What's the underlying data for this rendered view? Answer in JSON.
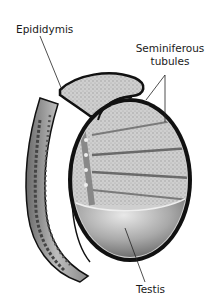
{
  "figure": {
    "labels": {
      "epididymis": "Epididymis",
      "seminiferous_line1": "Seminiferous",
      "seminiferous_line2": "tubules",
      "testis": "Testis"
    },
    "colors": {
      "background": "#ffffff",
      "outline": "#111111",
      "tissue_light": "#d9d9d9",
      "tissue_mid": "#a8a8a8",
      "tissue_dark": "#5a5a5a",
      "leader_line": "#222222"
    }
  }
}
